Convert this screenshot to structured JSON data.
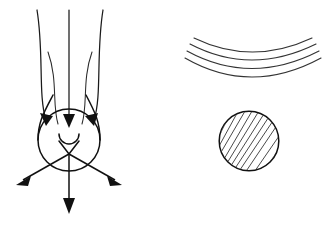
{
  "figure": {
    "background_color": "#ffffff",
    "ink_color": "#111111",
    "width": 334,
    "height": 228,
    "panels": [
      {
        "id": "left-panel",
        "name": "streamline-bulb-panel",
        "description": "Converging streamlines entering a teardrop bulb with a small cusp, and three arrows deflected outward"
      },
      {
        "id": "right-panel",
        "name": "wavefront-disk-panel",
        "description": "Four concentric curved wave fronts above a hatched circular disk"
      }
    ]
  },
  "left_panel": {
    "label": "converging-flow",
    "incoming_streamlines": [
      {
        "name": "streamline-outer-left",
        "start_x": 37,
        "start_y": 10
      },
      {
        "name": "streamline-inner-left",
        "start_x": 48,
        "start_y": 52
      },
      {
        "name": "streamline-center",
        "start_x": 70,
        "start_y": 10
      },
      {
        "name": "streamline-inner-right",
        "start_x": 92,
        "start_y": 52
      },
      {
        "name": "streamline-outer-right",
        "start_x": 103,
        "start_y": 10
      }
    ],
    "inflow_arrow_count": 3,
    "outflow_arrows": [
      {
        "name": "outflow-arrow-left",
        "tip_x": 17,
        "tip_y": 184
      },
      {
        "name": "outflow-arrow-down",
        "tip_x": 69,
        "tip_y": 213
      },
      {
        "name": "outflow-arrow-right",
        "tip_x": 121,
        "tip_y": 184
      }
    ],
    "bulb": {
      "name": "teardrop-bulb",
      "center_x": 69,
      "center_y": 151,
      "radius": 31
    },
    "cusp": {
      "name": "cusp-notch",
      "center_x": 69,
      "center_y": 139,
      "radius": 10
    }
  },
  "right_panel": {
    "label": "wave-fronts-and-disk",
    "wave_fronts": [
      {
        "name": "wave-front-1",
        "sag": 52
      },
      {
        "name": "wave-front-2",
        "sag": 61
      },
      {
        "name": "wave-front-3",
        "sag": 70
      },
      {
        "name": "wave-front-4",
        "sag": 78
      }
    ],
    "wave_front_count": 4,
    "disk": {
      "name": "hatched-disk",
      "center_x": 249,
      "center_y": 141,
      "radius": 30,
      "hatch_angle_degrees": 45,
      "hatch_spacing": 6,
      "hatch_color": "#4a4a4a"
    }
  }
}
